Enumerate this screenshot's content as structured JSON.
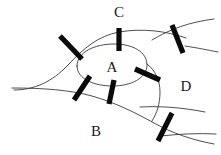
{
  "figure": {
    "kind": "topological-region-diagram",
    "width": 221,
    "height": 155,
    "background_color": "#ffffff",
    "curve_color": "#3a3a3a",
    "bar_color": "#0a0a0a",
    "label_color": "#1a1a1a",
    "labels": [
      {
        "text": "A",
        "x": 112,
        "y": 67,
        "name": "region-label-a"
      },
      {
        "text": "B",
        "x": 96,
        "y": 131,
        "name": "region-label-b"
      },
      {
        "text": "C",
        "x": 119,
        "y": 12,
        "name": "region-label-c"
      },
      {
        "text": "D",
        "x": 186,
        "y": 86,
        "name": "region-label-d"
      }
    ],
    "curves": [
      {
        "name": "central-oval-region-a",
        "d": "M 77 66 C 77 52 95 44 114 44 C 133 44 147 52 147 65 C 147 78 131 86 113 86 C 94 86 77 79 77 66 Z"
      },
      {
        "name": "upper-left-sweep-curve",
        "d": "M 14 90 C 34 90 52 82 68 65 C 84 48 98 36 119 32 C 143 28 166 31 186 38"
      },
      {
        "name": "upper-right-outer-curve",
        "d": "M 152 40 C 170 29 190 22 214 19"
      },
      {
        "name": "right-mid-curve",
        "d": "M 185 46 C 198 48 208 50 218 52"
      },
      {
        "name": "lower-left-horizontal-curve",
        "d": "M 12 88 C 44 88 70 90 92 96 C 116 103 134 112 154 123 C 172 133 192 140 214 144"
      },
      {
        "name": "region-d-left-boundary",
        "d": "M 147 64 C 155 70 160 80 160 92 C 160 104 157 113 152 121"
      },
      {
        "name": "region-d-lower-curve",
        "d": "M 140 107 C 158 106 180 107 205 112"
      },
      {
        "name": "bottom-right-trailing-curve",
        "d": "M 160 136 C 180 134 198 133 216 134"
      }
    ],
    "bars": [
      {
        "name": "bar-upper-left",
        "x1": 60,
        "y1": 36,
        "x2": 82,
        "y2": 59
      },
      {
        "name": "bar-top-c",
        "x1": 119,
        "y1": 28,
        "x2": 119,
        "y2": 51
      },
      {
        "name": "bar-upper-right",
        "x1": 172,
        "y1": 25,
        "x2": 183,
        "y2": 53
      },
      {
        "name": "bar-lower-left",
        "x1": 74,
        "y1": 100,
        "x2": 90,
        "y2": 76
      },
      {
        "name": "bar-bottom-a",
        "x1": 109,
        "y1": 104,
        "x2": 114,
        "y2": 80
      },
      {
        "name": "bar-right-a",
        "x1": 135,
        "y1": 69,
        "x2": 160,
        "y2": 80
      },
      {
        "name": "bar-lower-right",
        "x1": 158,
        "y1": 141,
        "x2": 172,
        "y2": 113
      }
    ]
  }
}
